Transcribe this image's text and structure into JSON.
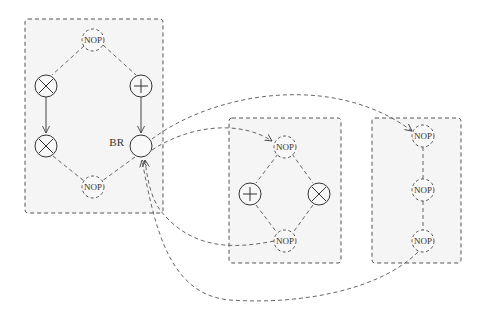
{
  "diagram": {
    "type": "control-flow graph with basic-block panels",
    "panels": [
      {
        "id": "block-1",
        "nodes": [
          {
            "id": "b1-nop-top",
            "kind": "NOP",
            "label": "NOP",
            "style": "dashed"
          },
          {
            "id": "b1-mul-1",
            "kind": "multiply",
            "symbol": "⊗",
            "style": "solid"
          },
          {
            "id": "b1-add",
            "kind": "add",
            "symbol": "⊕",
            "style": "solid"
          },
          {
            "id": "b1-mul-2",
            "kind": "multiply",
            "symbol": "⊗",
            "style": "solid"
          },
          {
            "id": "b1-br",
            "kind": "branch",
            "label": "BR",
            "style": "solid"
          },
          {
            "id": "b1-nop-bottom",
            "kind": "NOP",
            "label": "NOP",
            "style": "dashed"
          }
        ]
      },
      {
        "id": "block-2",
        "nodes": [
          {
            "id": "b2-nop-top",
            "kind": "NOP",
            "label": "NOP",
            "style": "dashed"
          },
          {
            "id": "b2-add",
            "kind": "add",
            "symbol": "⊕",
            "style": "solid"
          },
          {
            "id": "b2-mul",
            "kind": "multiply",
            "symbol": "⊗",
            "style": "solid"
          },
          {
            "id": "b2-nop-bottom",
            "kind": "NOP",
            "label": "NOP",
            "style": "dashed"
          }
        ]
      },
      {
        "id": "block-3",
        "nodes": [
          {
            "id": "b3-nop-1",
            "kind": "NOP",
            "label": "NOP",
            "style": "dashed"
          },
          {
            "id": "b3-nop-2",
            "kind": "NOP",
            "label": "NOP",
            "style": "dashed"
          },
          {
            "id": "b3-nop-3",
            "kind": "NOP",
            "label": "NOP",
            "style": "dashed"
          }
        ]
      }
    ],
    "edges": [
      {
        "from": "b1-nop-top",
        "to": "b1-mul-1",
        "style": "dashed"
      },
      {
        "from": "b1-nop-top",
        "to": "b1-add",
        "style": "dashed"
      },
      {
        "from": "b1-mul-1",
        "to": "b1-mul-2",
        "style": "solid-arrow"
      },
      {
        "from": "b1-add",
        "to": "b1-br",
        "style": "solid-arrow"
      },
      {
        "from": "b1-mul-2",
        "to": "b1-nop-bottom",
        "style": "dashed"
      },
      {
        "from": "b1-br",
        "to": "b1-nop-bottom",
        "style": "dashed"
      },
      {
        "from": "b1-br",
        "to": "b2-nop-top",
        "style": "dashed-arrow"
      },
      {
        "from": "b1-br",
        "to": "b3-nop-1",
        "style": "dashed-arrow"
      },
      {
        "from": "b2-nop-bottom",
        "to": "b1-br",
        "style": "dashed-arrow"
      },
      {
        "from": "b3-nop-3",
        "to": "b1-br",
        "style": "dashed-arrow"
      },
      {
        "from": "b2-nop-top",
        "to": "b2-add",
        "style": "dashed"
      },
      {
        "from": "b2-nop-top",
        "to": "b2-mul",
        "style": "dashed"
      },
      {
        "from": "b2-add",
        "to": "b2-nop-bottom",
        "style": "dashed"
      },
      {
        "from": "b2-mul",
        "to": "b2-nop-bottom",
        "style": "dashed"
      },
      {
        "from": "b3-nop-1",
        "to": "b3-nop-2",
        "style": "dashed"
      },
      {
        "from": "b3-nop-2",
        "to": "b3-nop-3",
        "style": "dashed"
      }
    ],
    "labels": {
      "nop": "NOP",
      "branch": "BR"
    }
  }
}
